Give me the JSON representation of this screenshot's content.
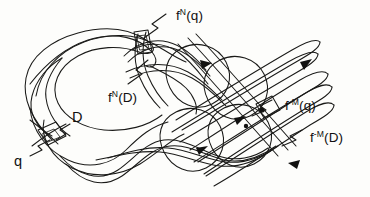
{
  "figure": {
    "name": "homoclinic-tangle",
    "background_color": "#fdfdfb",
    "ink_color": "#1a1a18"
  },
  "labels": {
    "fn_q": {
      "base": "f",
      "sup": "N",
      "arg": "(q)"
    },
    "fn_d": {
      "base": "f",
      "sup": "N",
      "arg": "(D)"
    },
    "fm_q": {
      "base": "f",
      "sup": "-M",
      "arg": "(q)"
    },
    "fm_d": {
      "base": "f",
      "sup": "-M",
      "arg": "(D)"
    },
    "d": {
      "text": "D"
    },
    "q": {
      "text": "q"
    }
  }
}
